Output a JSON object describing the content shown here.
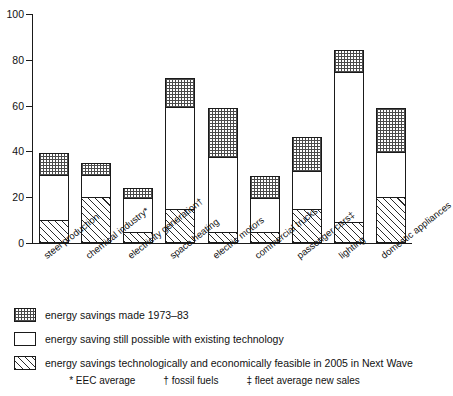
{
  "chart_data": {
    "type": "bar",
    "stacked": true,
    "title": "",
    "xlabel": "",
    "ylabel": "",
    "ylim": [
      0,
      100
    ],
    "yticks": [
      0,
      20,
      40,
      60,
      80,
      100
    ],
    "grid": false,
    "legend_position": "below",
    "categories": [
      "steel production",
      "chemical industry*",
      "electricity generation†",
      "space heating",
      "electric motors",
      "commercial trucks",
      "passenger cars‡",
      "lighting",
      "domestic appliances"
    ],
    "series": [
      {
        "name": "energy savings technologically and economically feasible in 2005 in Next Wave",
        "pattern": "diagonal-stripes",
        "values": [
          10,
          20,
          5,
          15,
          5,
          5,
          15,
          9,
          20
        ]
      },
      {
        "name": "energy saving still possible with existing technology",
        "pattern": "blank",
        "values": [
          20,
          10,
          15,
          45,
          33,
          15,
          17,
          66,
          20
        ]
      },
      {
        "name": "energy savings made 1973–83",
        "pattern": "cross-hatch",
        "values": [
          10,
          6,
          5,
          13,
          22,
          10,
          15,
          10,
          20
        ]
      }
    ],
    "totals": [
      40,
      36,
      25,
      73,
      60,
      30,
      47,
      85,
      60
    ]
  },
  "legend": {
    "items": [
      {
        "pattern": "cross-hatch",
        "label": "energy savings made 1973–83"
      },
      {
        "pattern": "blank",
        "label": "energy saving still possible with existing technology"
      },
      {
        "pattern": "diagonal-stripes",
        "label": "energy savings technologically and economically feasible in 2005 in Next Wave"
      }
    ]
  },
  "footnotes": [
    "* EEC average",
    "† fossil fuels",
    "‡ fleet average new sales"
  ]
}
